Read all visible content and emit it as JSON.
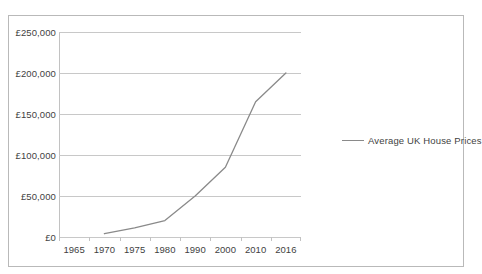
{
  "clipped_title_text": "",
  "legend": {
    "position": "right",
    "entries": [
      {
        "label": "Average UK House Prices",
        "color": "#8a8a8a",
        "marker": "line"
      }
    ]
  },
  "axes": {
    "y_tick_labels": [
      "£250,000",
      "£200,000",
      "£150,000",
      "£100,000",
      "£50,000",
      "£0"
    ],
    "x_tick_labels": [
      "1965",
      "1970",
      "1975",
      "1980",
      "1990",
      "2000",
      "2010",
      "2016"
    ]
  },
  "chart_data": {
    "type": "line",
    "title": "",
    "subtitle": "",
    "xlabel": "",
    "ylabel": "",
    "grid": true,
    "legend_position": "right",
    "x": [
      1965,
      1970,
      1975,
      1980,
      1990,
      2000,
      2010,
      2016
    ],
    "x_tick_labels": [
      "1965",
      "1970",
      "1975",
      "1980",
      "1990",
      "2000",
      "2010",
      "2016"
    ],
    "y_ticks": [
      0,
      50000,
      100000,
      150000,
      200000,
      250000
    ],
    "y_tick_labels": [
      "£0",
      "£50,000",
      "£100,000",
      "£150,000",
      "£200,000",
      "£250,000"
    ],
    "ylim": [
      0,
      250000
    ],
    "series": [
      {
        "name": "Average UK House Prices",
        "color": "#8a8a8a",
        "x": [
          1970,
          1975,
          1980,
          1990,
          2000,
          2010,
          2016
        ],
        "values": [
          4000,
          11000,
          20000,
          50000,
          85000,
          165000,
          200000
        ]
      }
    ]
  }
}
